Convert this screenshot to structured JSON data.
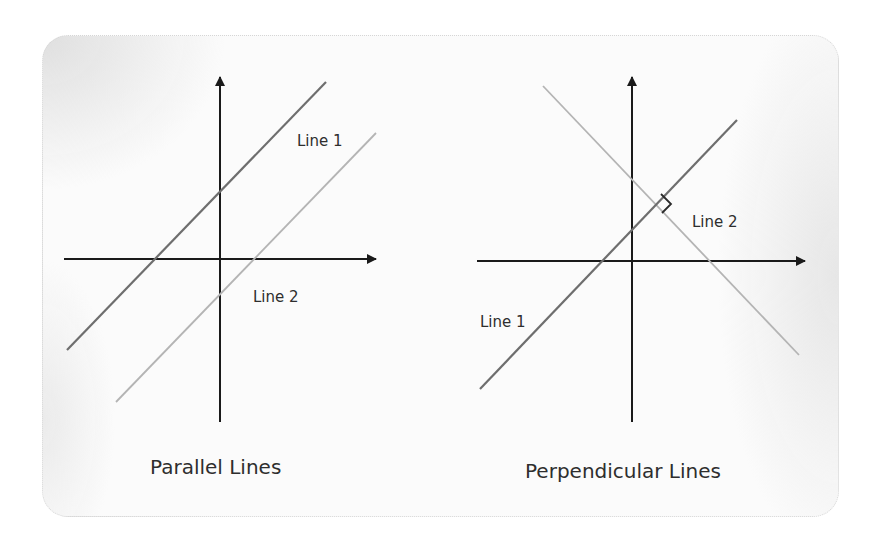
{
  "colors": {
    "axis": "#1a1a1a",
    "line_dark": "#6e6e6e",
    "line_light": "#b4b4b4",
    "text": "#2e2e2e",
    "marker": "#2a2a2a"
  },
  "left_diagram": {
    "title": "Parallel Lines",
    "line1_label": "Line 1",
    "line2_label": "Line 2",
    "axes": {
      "vertical": {
        "x": 220,
        "y_top": 75,
        "y_bottom": 422
      },
      "horizontal": {
        "y": 259,
        "x_left": 64,
        "x_right": 378
      }
    },
    "line1": {
      "x1": 67,
      "y1": 350,
      "x2": 326,
      "y2": 82
    },
    "line2": {
      "x1": 116,
      "y1": 402,
      "x2": 376,
      "y2": 133
    }
  },
  "right_diagram": {
    "title": "Perpendicular Lines",
    "line1_label": "Line 1",
    "line2_label": "Line 2",
    "axes": {
      "vertical": {
        "x": 632,
        "y_top": 75,
        "y_bottom": 422
      },
      "horizontal": {
        "y": 261,
        "x_left": 477,
        "x_right": 807
      }
    },
    "line1": {
      "x1": 480,
      "y1": 389,
      "x2": 737,
      "y2": 120
    },
    "line2": {
      "x1": 543,
      "y1": 86,
      "x2": 799,
      "y2": 355
    },
    "right_angle_marker": "right-angle-symbol"
  }
}
